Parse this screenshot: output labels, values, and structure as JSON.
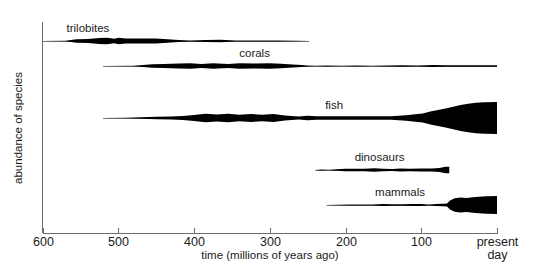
{
  "chart_data": {
    "type": "area",
    "title": "",
    "xlabel": "time (millions of years ago)",
    "ylabel": "abundance of species",
    "xlim": [
      600,
      0
    ],
    "x_tick_values": [
      600,
      500,
      400,
      300,
      200,
      100,
      0
    ],
    "x_tick_labels": [
      "600",
      "500",
      "400",
      "300",
      "200",
      "100",
      "present day"
    ],
    "x_axis_reversed": true,
    "grid": false,
    "legend": "none",
    "note": "Spindle diagram: each series is a horizontal symmetric band whose half-width encodes abundance of species at that time.",
    "series": [
      {
        "name": "trilobites",
        "label": "trilobites",
        "label_x": 540,
        "start_mya": 600,
        "end_mya": 248,
        "points": [
          {
            "mya": 600,
            "abundance": 0.0
          },
          {
            "mya": 570,
            "abundance": 0.6
          },
          {
            "mya": 555,
            "abundance": 3.6
          },
          {
            "mya": 540,
            "abundance": 4.2
          },
          {
            "mya": 525,
            "abundance": 6.0
          },
          {
            "mya": 515,
            "abundance": 6.4
          },
          {
            "mya": 505,
            "abundance": 4.4
          },
          {
            "mya": 500,
            "abundance": 6.6
          },
          {
            "mya": 490,
            "abundance": 5.0
          },
          {
            "mya": 470,
            "abundance": 5.0
          },
          {
            "mya": 450,
            "abundance": 5.2
          },
          {
            "mya": 435,
            "abundance": 3.4
          },
          {
            "mya": 420,
            "abundance": 1.8
          },
          {
            "mya": 405,
            "abundance": 1.0
          },
          {
            "mya": 385,
            "abundance": 2.2
          },
          {
            "mya": 365,
            "abundance": 2.4
          },
          {
            "mya": 345,
            "abundance": 1.2
          },
          {
            "mya": 320,
            "abundance": 1.0
          },
          {
            "mya": 290,
            "abundance": 0.8
          },
          {
            "mya": 265,
            "abundance": 0.4
          },
          {
            "mya": 248,
            "abundance": 0.0
          }
        ]
      },
      {
        "name": "corals",
        "label": "corals",
        "label_x": 320,
        "start_mya": 520,
        "end_mya": 0,
        "points": [
          {
            "mya": 520,
            "abundance": 0.0
          },
          {
            "mya": 480,
            "abundance": 0.5
          },
          {
            "mya": 455,
            "abundance": 3.4
          },
          {
            "mya": 440,
            "abundance": 3.8
          },
          {
            "mya": 420,
            "abundance": 5.2
          },
          {
            "mya": 405,
            "abundance": 5.6
          },
          {
            "mya": 390,
            "abundance": 4.0
          },
          {
            "mya": 375,
            "abundance": 5.4
          },
          {
            "mya": 355,
            "abundance": 4.2
          },
          {
            "mya": 340,
            "abundance": 5.6
          },
          {
            "mya": 320,
            "abundance": 5.0
          },
          {
            "mya": 300,
            "abundance": 5.6
          },
          {
            "mya": 285,
            "abundance": 4.4
          },
          {
            "mya": 270,
            "abundance": 3.2
          },
          {
            "mya": 258,
            "abundance": 2.0
          },
          {
            "mya": 250,
            "abundance": 0.8
          },
          {
            "mya": 240,
            "abundance": 0.5
          },
          {
            "mya": 225,
            "abundance": 0.8
          },
          {
            "mya": 205,
            "abundance": 0.6
          },
          {
            "mya": 185,
            "abundance": 0.9
          },
          {
            "mya": 165,
            "abundance": 0.7
          },
          {
            "mya": 145,
            "abundance": 1.0
          },
          {
            "mya": 125,
            "abundance": 1.5
          },
          {
            "mya": 105,
            "abundance": 1.1
          },
          {
            "mya": 85,
            "abundance": 1.9
          },
          {
            "mya": 65,
            "abundance": 1.5
          },
          {
            "mya": 45,
            "abundance": 1.5
          },
          {
            "mya": 20,
            "abundance": 1.5
          },
          {
            "mya": 0,
            "abundance": 1.5
          }
        ]
      },
      {
        "name": "fish",
        "label": "fish",
        "label_x": 215,
        "start_mya": 520,
        "end_mya": 0,
        "points": [
          {
            "mya": 520,
            "abundance": 0.0
          },
          {
            "mya": 490,
            "abundance": 0.7
          },
          {
            "mya": 470,
            "abundance": 1.6
          },
          {
            "mya": 450,
            "abundance": 2.6
          },
          {
            "mya": 430,
            "abundance": 3.2
          },
          {
            "mya": 415,
            "abundance": 4.0
          },
          {
            "mya": 400,
            "abundance": 6.2
          },
          {
            "mya": 385,
            "abundance": 8.4
          },
          {
            "mya": 370,
            "abundance": 7.2
          },
          {
            "mya": 355,
            "abundance": 8.6
          },
          {
            "mya": 340,
            "abundance": 6.6
          },
          {
            "mya": 325,
            "abundance": 8.0
          },
          {
            "mya": 310,
            "abundance": 6.6
          },
          {
            "mya": 295,
            "abundance": 7.8
          },
          {
            "mya": 280,
            "abundance": 5.0
          },
          {
            "mya": 262,
            "abundance": 2.8
          },
          {
            "mya": 250,
            "abundance": 4.4
          },
          {
            "mya": 238,
            "abundance": 3.6
          },
          {
            "mya": 215,
            "abundance": 3.4
          },
          {
            "mya": 190,
            "abundance": 3.4
          },
          {
            "mya": 165,
            "abundance": 3.4
          },
          {
            "mya": 140,
            "abundance": 3.6
          },
          {
            "mya": 120,
            "abundance": 5.6
          },
          {
            "mya": 108,
            "abundance": 7.4
          },
          {
            "mya": 98,
            "abundance": 9.0
          },
          {
            "mya": 88,
            "abundance": 13.0
          },
          {
            "mya": 78,
            "abundance": 16.0
          },
          {
            "mya": 68,
            "abundance": 19.0
          },
          {
            "mya": 58,
            "abundance": 22.5
          },
          {
            "mya": 48,
            "abundance": 26.0
          },
          {
            "mya": 38,
            "abundance": 28.5
          },
          {
            "mya": 28,
            "abundance": 30.5
          },
          {
            "mya": 16,
            "abundance": 31.5
          },
          {
            "mya": 0,
            "abundance": 32.0
          }
        ]
      },
      {
        "name": "dinosaurs",
        "label": "dinosaurs",
        "label_x": 155,
        "start_mya": 240,
        "end_mya": 63,
        "points": [
          {
            "mya": 240,
            "abundance": 0.0
          },
          {
            "mya": 232,
            "abundance": 0.8
          },
          {
            "mya": 222,
            "abundance": 0.7
          },
          {
            "mya": 212,
            "abundance": 1.6
          },
          {
            "mya": 200,
            "abundance": 2.4
          },
          {
            "mya": 188,
            "abundance": 2.4
          },
          {
            "mya": 175,
            "abundance": 2.4
          },
          {
            "mya": 162,
            "abundance": 3.4
          },
          {
            "mya": 150,
            "abundance": 2.6
          },
          {
            "mya": 138,
            "abundance": 2.2
          },
          {
            "mya": 128,
            "abundance": 3.0
          },
          {
            "mya": 115,
            "abundance": 2.4
          },
          {
            "mya": 100,
            "abundance": 2.8
          },
          {
            "mya": 86,
            "abundance": 3.0
          },
          {
            "mya": 76,
            "abundance": 4.0
          },
          {
            "mya": 68,
            "abundance": 6.4
          },
          {
            "mya": 65,
            "abundance": 6.6
          },
          {
            "mya": 63,
            "abundance": 6.6
          }
        ]
      },
      {
        "name": "mammals",
        "label": "mammals",
        "label_x": 128,
        "start_mya": 225,
        "end_mya": 0,
        "points": [
          {
            "mya": 225,
            "abundance": 0.0
          },
          {
            "mya": 210,
            "abundance": 0.5
          },
          {
            "mya": 195,
            "abundance": 0.8
          },
          {
            "mya": 180,
            "abundance": 1.0
          },
          {
            "mya": 165,
            "abundance": 1.2
          },
          {
            "mya": 150,
            "abundance": 2.0
          },
          {
            "mya": 138,
            "abundance": 1.6
          },
          {
            "mya": 125,
            "abundance": 1.4
          },
          {
            "mya": 112,
            "abundance": 2.2
          },
          {
            "mya": 100,
            "abundance": 1.8
          },
          {
            "mya": 90,
            "abundance": 1.2
          },
          {
            "mya": 80,
            "abundance": 2.2
          },
          {
            "mya": 72,
            "abundance": 2.6
          },
          {
            "mya": 66,
            "abundance": 3.0
          },
          {
            "mya": 62,
            "abundance": 9.0
          },
          {
            "mya": 56,
            "abundance": 13.5
          },
          {
            "mya": 48,
            "abundance": 15.0
          },
          {
            "mya": 40,
            "abundance": 14.0
          },
          {
            "mya": 32,
            "abundance": 15.5
          },
          {
            "mya": 24,
            "abundance": 16.5
          },
          {
            "mya": 14,
            "abundance": 17.5
          },
          {
            "mya": 0,
            "abundance": 18.0
          }
        ]
      }
    ]
  },
  "axes": {
    "x_title": "time (millions of years ago)",
    "y_title": "abundance of species",
    "ticks": [
      {
        "value": 600,
        "label": "600"
      },
      {
        "value": 500,
        "label": "500"
      },
      {
        "value": 400,
        "label": "400"
      },
      {
        "value": 300,
        "label": "300"
      },
      {
        "value": 200,
        "label": "200"
      },
      {
        "value": 100,
        "label": "100"
      },
      {
        "value": 0,
        "label": "present"
      }
    ],
    "present_day_line2": "day"
  },
  "colors": {
    "ink": "#000000",
    "axis": "#6d6d6d",
    "background": "#ffffff",
    "text": "#1a1a1a"
  }
}
